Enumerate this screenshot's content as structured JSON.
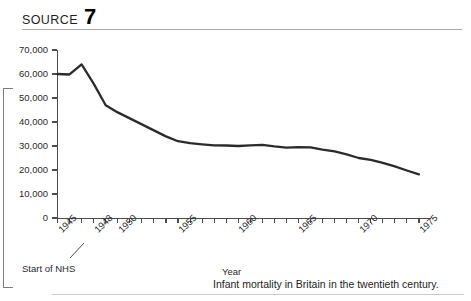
{
  "source": {
    "label": "SOURCE",
    "number": "7"
  },
  "caption": "Infant mortality in Britain in the twentieth century.",
  "annotation": {
    "nhs": "Start of NHS"
  },
  "colors": {
    "line": "#2b2b2b",
    "axis": "#4a4a4f",
    "text": "#1c1c1c",
    "rule": "#a8a8ae",
    "border": "#7d7d88",
    "background": "#ffffff"
  },
  "chart_data": {
    "type": "line",
    "title": "Infant mortality in Britain in the twentieth century.",
    "xlabel": "Year",
    "ylabel": "",
    "xlim": [
      1945,
      1976
    ],
    "ylim": [
      0,
      70000
    ],
    "ytick_labels": [
      "70,000",
      "60,000",
      "50,000",
      "40,000",
      "30,000",
      "20,000",
      "10,000",
      "0"
    ],
    "ytick_values": [
      70000,
      60000,
      50000,
      40000,
      30000,
      20000,
      10000,
      0
    ],
    "xtick_labels": [
      "1945",
      "1948",
      "1950",
      "1955",
      "1960",
      "1965",
      "1970",
      "1975"
    ],
    "xtick_values": [
      1945,
      1948,
      1950,
      1955,
      1960,
      1965,
      1970,
      1975
    ],
    "grid": false,
    "legend": false,
    "annotations": [
      {
        "text": "Start of NHS",
        "points_to": "1948"
      }
    ],
    "series": [
      {
        "name": "Infant deaths",
        "x": [
          1945,
          1946,
          1947,
          1948,
          1949,
          1950,
          1951,
          1952,
          1953,
          1954,
          1955,
          1956,
          1957,
          1958,
          1959,
          1960,
          1961,
          1962,
          1963,
          1964,
          1965,
          1966,
          1967,
          1968,
          1969,
          1970,
          1971,
          1972,
          1973,
          1974,
          1975
        ],
        "values": [
          60000,
          59800,
          64000,
          56000,
          47000,
          44000,
          41500,
          39000,
          36500,
          34000,
          32000,
          31200,
          30700,
          30300,
          30200,
          30000,
          30300,
          30500,
          29800,
          29300,
          29500,
          29400,
          28500,
          27800,
          26500,
          25000,
          24200,
          23000,
          21500,
          19800,
          18200
        ]
      }
    ]
  }
}
